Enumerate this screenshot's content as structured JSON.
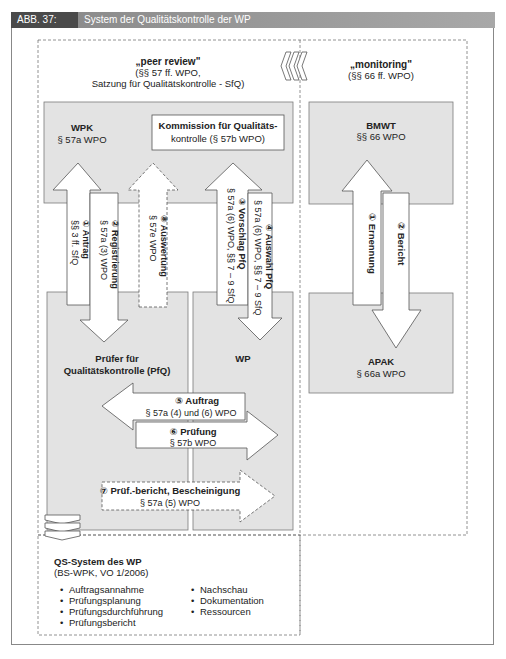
{
  "figure": {
    "label": "ABB. 37:",
    "title": "System der Qualitätskontrolle der WP"
  },
  "peer_review": {
    "title": "„peer review\"",
    "line2": "(§§ 57 ff. WPO,",
    "line3": "Satzung für Qualitätskontrolle - SfQ)"
  },
  "monitoring": {
    "title": "„monitoring\"",
    "line2": "(§§ 66 ff. WPO)"
  },
  "boxes": {
    "wpk": {
      "name": "WPK",
      "ref": "§ 57a WPO"
    },
    "kommission": {
      "line1": "Kommission für Qualitäts-",
      "line2": "kontrolle (§ 57b WPO)"
    },
    "bmwt": {
      "name": "BMWT",
      "ref": "§§ 66 WPO"
    },
    "apak": {
      "name": "APAK",
      "ref": "§ 66a WPO"
    },
    "pruefer": {
      "line1": "Prüfer für",
      "line2": "Qualitätskontrolle (PfQ)"
    },
    "wp": {
      "name": "WP"
    }
  },
  "arrows": {
    "a1": {
      "label": "① Antrag",
      "ref": "§§ 3 ff. SfQ"
    },
    "a2": {
      "label": "② Registrierung",
      "ref": "§ 57a (3) WPO"
    },
    "a3": {
      "label": "③ Vorschlag PfQ",
      "ref": "§ 57a (6) WPO, §§ 7 – 9 SfQ"
    },
    "a4": {
      "label": "④ Auswahl PfQ",
      "ref": "§ 57a (6) WPO, §§ 7 – 9 SfQ"
    },
    "a5": {
      "label": "⑤ Auftrag",
      "ref": "§ 57a (4) und (6) WPO"
    },
    "a6": {
      "label": "⑥ Prüfung",
      "ref": "§ 57b WPO"
    },
    "a7": {
      "label": "⑦  Prüf.-bericht, Bescheinigung",
      "ref": "§ 57a (5) WPO"
    },
    "a8": {
      "label": "⑧ Auswertung",
      "ref": "§ 57e WPO"
    },
    "m1": {
      "label": "① Ernennung"
    },
    "m2": {
      "label": "② Bericht"
    }
  },
  "qs_system": {
    "title": "QS-System des WP",
    "subtitle": "(BS-WPK, VO 1/2006)",
    "col1": [
      "Auftragsannahme",
      "Prüfungsplanung",
      "Prüfungsdurchführung",
      "Prüfungsbericht"
    ],
    "col2": [
      "Nachschau",
      "Dokumentation",
      "Ressourcen"
    ],
    "bullet": "•"
  },
  "colors": {
    "panel_fill": "#e3e3e3",
    "panel_stroke": "#7a7a7a",
    "header_dark": "#4a4a4a",
    "header_light": "#9a9a9a",
    "dash": "#777777"
  }
}
